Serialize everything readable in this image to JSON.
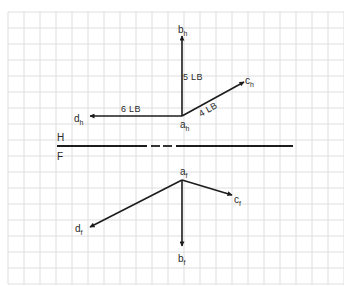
{
  "diagram": {
    "type": "orthographic-vector-projection",
    "grid": {
      "x0": 8,
      "y0": 12,
      "cell": 16,
      "cols": 21,
      "rows": 17,
      "color": "#d6d6d6",
      "background": "#ffffff"
    },
    "colors": {
      "ink": "#1c1c1c",
      "text": "#2a2a2a"
    },
    "fold_line": {
      "y": 146,
      "segments": [
        [
          57,
          147
        ],
        [
          151,
          160
        ],
        [
          163,
          172
        ],
        [
          176,
          293
        ]
      ],
      "label_top": "H",
      "label_bottom": "F"
    },
    "horizontal_view": {
      "origin": {
        "name": "a",
        "sub": "h",
        "x": 182,
        "y": 116
      },
      "vectors": [
        {
          "id": "b_h",
          "name": "b",
          "sub": "h",
          "x2": 182,
          "y2": 36,
          "magnitude_label": "5 LB",
          "label_x": 185,
          "label_y": 44
        },
        {
          "id": "c_h",
          "name": "c",
          "sub": "h",
          "x2": 244,
          "y2": 82,
          "magnitude_label": "4 LB",
          "label_x": 245,
          "label_y": 84
        },
        {
          "id": "d_h",
          "name": "d",
          "sub": "h",
          "x2": 90,
          "y2": 116,
          "magnitude_label": "6 LB",
          "label_x": 74,
          "label_y": 124
        }
      ]
    },
    "frontal_view": {
      "origin": {
        "name": "a",
        "sub": "f",
        "x": 182,
        "y": 180
      },
      "vectors": [
        {
          "id": "b_f",
          "name": "b",
          "sub": "f",
          "x2": 182,
          "y2": 246,
          "label_x": 178,
          "label_y": 262
        },
        {
          "id": "c_f",
          "name": "c",
          "sub": "f",
          "x2": 232,
          "y2": 195,
          "label_x": 234,
          "label_y": 204
        },
        {
          "id": "d_f",
          "name": "d",
          "sub": "f",
          "x2": 90,
          "y2": 227,
          "label_x": 75,
          "label_y": 234
        }
      ]
    },
    "magnitudes": {
      "b": "5 LB",
      "c": "4 LB",
      "d": "6 LB"
    }
  }
}
